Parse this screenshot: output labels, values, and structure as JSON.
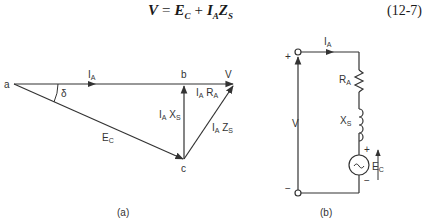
{
  "equation": {
    "lhs": "V",
    "eq": "=",
    "term1": "E",
    "term1_sub": "C",
    "plus": "+",
    "term2a": "I",
    "term2a_sub": "A",
    "term2b": "Z",
    "term2b_sub": "S",
    "number": "(12-7)"
  },
  "phasor": {
    "points": {
      "a": "a",
      "b": "b",
      "c": "c",
      "v": "V"
    },
    "angle": "δ",
    "vectors": {
      "ia": {
        "main": "I",
        "sub": "A"
      },
      "ec": {
        "main": "E",
        "sub": "C"
      },
      "iaxs": {
        "main1": "I",
        "sub1": "A",
        "main2": " X",
        "sub2": "S"
      },
      "iara": {
        "main1": "I",
        "sub1": "A",
        "main2": " R",
        "sub2": "A"
      },
      "iazs": {
        "main1": "I",
        "sub1": "A",
        "main2": " Z",
        "sub2": "S"
      }
    },
    "caption": "(a)"
  },
  "circuit": {
    "current": {
      "main": "I",
      "sub": "A"
    },
    "resistor": {
      "main": "R",
      "sub": "A"
    },
    "reactance": {
      "main": "X",
      "sub": "S"
    },
    "source": {
      "main": "E",
      "sub": "C",
      "symbol": "~"
    },
    "voltage": "V",
    "plus": "+",
    "minus": "−",
    "caption": "(b)"
  }
}
